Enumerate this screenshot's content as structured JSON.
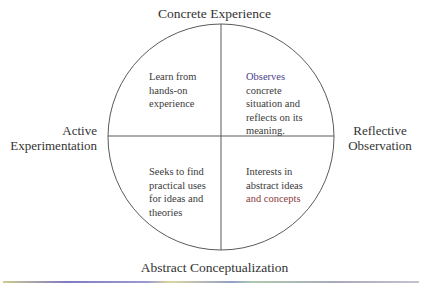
{
  "diagram": {
    "poles": {
      "top": "Concrete Experience",
      "bottom": "Abstract Conceptualization",
      "left": [
        "Active",
        "Experimentation"
      ],
      "right": [
        "Reflective",
        "Observation"
      ]
    },
    "quadrants": {
      "top_left": [
        "Learn from",
        "hands-on",
        "experience"
      ],
      "top_right": [
        "Observes",
        "concrete",
        "situation and",
        "reflects on its",
        "meaning."
      ],
      "bottom_left": [
        "Seeks to find",
        "practical uses",
        "for ideas and",
        "theories"
      ],
      "bottom_right": [
        "Interests in",
        "abstract ideas",
        "and concepts"
      ]
    },
    "geometry": {
      "cx": 221,
      "cy": 137,
      "r": 113
    },
    "colors": {
      "stroke": "#555555",
      "text": "#333333"
    }
  }
}
